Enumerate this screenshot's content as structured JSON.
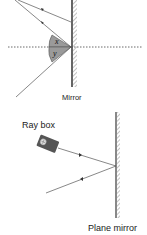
{
  "diagram1": {
    "mirror_label": "Mirror",
    "angle_labels": [
      "x",
      "y"
    ],
    "colors": {
      "line": "#555555",
      "sector": "#9a9a9a",
      "mirror": "#777777",
      "normal": "#444444"
    }
  },
  "diagram2": {
    "ray_box_label": "Ray box",
    "mirror_label": "Plane mirror",
    "colors": {
      "line": "#555555",
      "box": "#555555",
      "mirror": "#888888"
    }
  }
}
